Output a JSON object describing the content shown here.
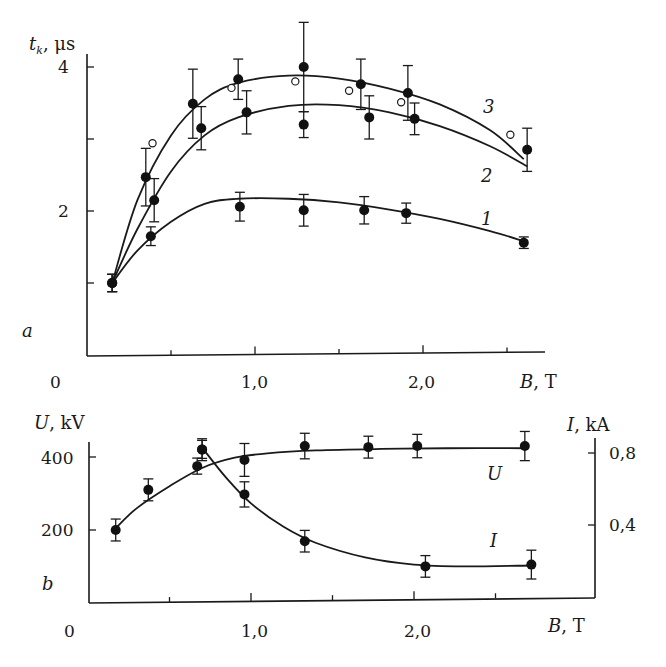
{
  "chart_data": [
    {
      "panel": "a",
      "type": "scatter",
      "title": "",
      "xlabel": "B, T",
      "ylabel": "t_k, μs",
      "xlim": [
        0,
        2.8
      ],
      "ylim": [
        0.0,
        4.3
      ],
      "x_ticks": [
        0,
        0.5,
        1.0,
        1.5,
        2.0,
        2.5
      ],
      "x_tick_labels": [
        "0",
        "",
        "1,0",
        "",
        "2,0",
        ""
      ],
      "y_ticks": [
        1,
        2,
        3,
        4
      ],
      "y_tick_labels": [
        "",
        "2",
        "",
        "4"
      ],
      "grid": false,
      "series": [
        {
          "name": "1",
          "marker": "filled-circle",
          "x": [
            0.15,
            0.38,
            0.91,
            1.29,
            1.65,
            1.9,
            2.6
          ],
          "y": [
            1.0,
            1.65,
            2.06,
            2.01,
            2.01,
            1.97,
            1.56
          ],
          "err": [
            0.12,
            0.13,
            0.2,
            0.22,
            0.19,
            0.14,
            0.08
          ],
          "fit": [
            [
              0.15,
              1.0
            ],
            [
              0.3,
              1.45
            ],
            [
              0.5,
              1.85
            ],
            [
              0.7,
              2.1
            ],
            [
              0.9,
              2.17
            ],
            [
              1.2,
              2.17
            ],
            [
              1.5,
              2.12
            ],
            [
              1.8,
              2.02
            ],
            [
              2.1,
              1.89
            ],
            [
              2.4,
              1.72
            ],
            [
              2.6,
              1.58
            ]
          ]
        },
        {
          "name": "2",
          "marker": "filled-circle",
          "x": [
            0.15,
            0.4,
            0.68,
            0.95,
            1.29,
            1.68,
            1.95,
            2.62
          ],
          "y": [
            1.0,
            2.15,
            3.15,
            3.37,
            3.2,
            3.3,
            3.28,
            2.85
          ],
          "err": [
            0.12,
            0.3,
            0.3,
            0.3,
            0.18,
            0.3,
            0.22,
            0.3
          ],
          "fit": [
            [
              0.15,
              1.0
            ],
            [
              0.3,
              1.75
            ],
            [
              0.5,
              2.55
            ],
            [
              0.7,
              3.05
            ],
            [
              0.9,
              3.3
            ],
            [
              1.2,
              3.46
            ],
            [
              1.5,
              3.47
            ],
            [
              1.8,
              3.37
            ],
            [
              2.1,
              3.18
            ],
            [
              2.4,
              2.9
            ],
            [
              2.62,
              2.62
            ]
          ]
        },
        {
          "name": "3",
          "marker": "filled-circle",
          "x": [
            0.15,
            0.35,
            0.63,
            0.9,
            1.29,
            1.63,
            1.91
          ],
          "y": [
            1.0,
            2.47,
            3.49,
            3.83,
            4.0,
            3.76,
            3.64
          ],
          "err": [
            0.12,
            0.4,
            0.48,
            0.28,
            0.62,
            0.35,
            0.38
          ],
          "fit": [
            [
              0.15,
              1.0
            ],
            [
              0.3,
              2.15
            ],
            [
              0.5,
              3.05
            ],
            [
              0.7,
              3.55
            ],
            [
              0.9,
              3.78
            ],
            [
              1.2,
              3.88
            ],
            [
              1.5,
              3.84
            ],
            [
              1.8,
              3.7
            ],
            [
              2.1,
              3.48
            ],
            [
              2.4,
              3.12
            ],
            [
              2.6,
              2.72
            ]
          ]
        },
        {
          "name": "open circles",
          "marker": "open-circle",
          "x": [
            0.39,
            0.86,
            1.24,
            1.56,
            1.87,
            2.52
          ],
          "y": [
            2.94,
            3.71,
            3.8,
            3.67,
            3.51,
            3.06
          ]
        }
      ],
      "annotations": [
        {
          "text": "1",
          "x": 2.2,
          "y": 1.75
        },
        {
          "text": "2",
          "x": 2.2,
          "y": 2.7
        },
        {
          "text": "3",
          "x": 2.2,
          "y": 3.31
        },
        {
          "text": "a",
          "note": "panel label"
        }
      ]
    },
    {
      "panel": "b",
      "type": "scatter",
      "title": "",
      "xlabel": "B, T",
      "ylabel": "U, kV",
      "ylabel_right": "I, kA",
      "xlim": [
        0,
        3.0
      ],
      "ylim": [
        0,
        450
      ],
      "ylim_right": [
        0,
        0.9
      ],
      "x_ticks": [
        0,
        0.5,
        1.0,
        1.5,
        2.0,
        2.5
      ],
      "x_tick_labels": [
        "0",
        "",
        "1,0",
        "",
        "2,0",
        ""
      ],
      "y_ticks": [
        200,
        400
      ],
      "y_tick_labels": [
        "200",
        "400"
      ],
      "y_ticks_right": [
        0.4,
        0.8
      ],
      "y_tick_labels_right": [
        "0,4",
        "0,8"
      ],
      "grid": false,
      "series": [
        {
          "name": "U",
          "axis": "left",
          "marker": "filled-circle",
          "x": [
            0.17,
            0.37,
            0.67,
            0.7,
            0.96,
            1.33,
            1.72,
            2.02,
            2.68
          ],
          "y": [
            200,
            310,
            375,
            420,
            392,
            430,
            427,
            430,
            430
          ],
          "err": [
            30,
            30,
            22,
            30,
            45,
            35,
            30,
            32,
            40
          ],
          "fit": [
            [
              0.17,
              205
            ],
            [
              0.3,
              260
            ],
            [
              0.5,
              320
            ],
            [
              0.7,
              370
            ],
            [
              0.9,
              398
            ],
            [
              1.1,
              410
            ],
            [
              1.4,
              418
            ],
            [
              1.8,
              422
            ],
            [
              2.2,
              424
            ],
            [
              2.68,
              424
            ]
          ]
        },
        {
          "name": "I",
          "axis": "right",
          "marker": "filled-circle",
          "x": [
            0.7,
            0.96,
            1.33,
            2.07,
            2.72
          ],
          "y": [
            0.82,
            0.57,
            0.31,
            0.17,
            0.18
          ],
          "err": [
            0.05,
            0.07,
            0.06,
            0.06,
            0.08
          ],
          "fit": [
            [
              0.7,
              0.83
            ],
            [
              0.85,
              0.66
            ],
            [
              1.0,
              0.52
            ],
            [
              1.2,
              0.39
            ],
            [
              1.4,
              0.3
            ],
            [
              1.7,
              0.22
            ],
            [
              2.0,
              0.18
            ],
            [
              2.3,
              0.17
            ],
            [
              2.72,
              0.175
            ]
          ]
        }
      ],
      "annotations": [
        {
          "text": "U",
          "x": 2.25,
          "y_left": 335
        },
        {
          "text": "I",
          "x": 2.25,
          "y_right": 0.33
        },
        {
          "text": "b",
          "note": "panel label"
        }
      ]
    }
  ],
  "labels": {
    "a_ylabel_t": "t",
    "a_ylabel_sub": "k",
    "a_ylabel_unit": ", μs",
    "a_y4": "4",
    "a_y2": "2",
    "a_x0": "0",
    "a_x1": "1,0",
    "a_x2": "2,0",
    "a_xlabel_var": "B",
    "a_xlabel_unit": ", T",
    "a_panel": "a",
    "a_c1": "1",
    "a_c2": "2",
    "a_c3": "3",
    "b_ylabel_var": "U",
    "b_ylabel_unit": ", kV",
    "b_y400": "400",
    "b_y200": "200",
    "b_x0": "0",
    "b_x1": "1,0",
    "b_x2": "2,0",
    "b_xlabel_var": "B",
    "b_xlabel_unit": ", T",
    "b_panel": "b",
    "b_rlabel_var": "I",
    "b_rlabel_unit": ", kA",
    "b_r08": "0,8",
    "b_r04": "0,4",
    "b_cU": "U",
    "b_cI": "I"
  }
}
